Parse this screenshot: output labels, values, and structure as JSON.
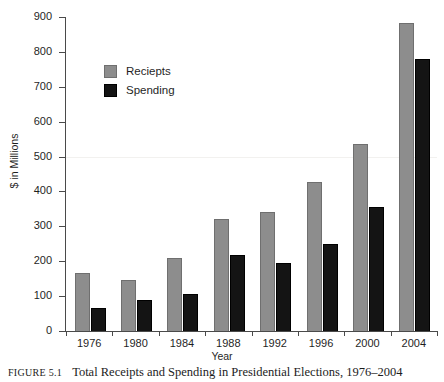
{
  "chart_data": {
    "type": "bar",
    "title": "",
    "xlabel": "Year",
    "ylabel": "$ in Millions",
    "categories": [
      "1976",
      "1980",
      "1984",
      "1988",
      "1992",
      "1996",
      "2000",
      "2004"
    ],
    "series": [
      {
        "name": "Reciepts",
        "color": "#8d8d8d",
        "values": [
          165,
          146,
          209,
          322,
          340,
          428,
          535,
          882
        ]
      },
      {
        "name": "Spending",
        "color": "#141414",
        "values": [
          67,
          89,
          105,
          217,
          195,
          249,
          355,
          779
        ]
      }
    ],
    "ylim": [
      0,
      900
    ],
    "yticks": [
      0,
      100,
      200,
      300,
      400,
      500,
      600,
      700,
      800,
      900
    ],
    "ytick_labels": [
      "0",
      "100",
      "200",
      "300",
      "400",
      "500",
      "600",
      "700",
      "800",
      "900"
    ],
    "grid": false,
    "legend_position": "upper-left-inside"
  },
  "legend": {
    "entries": [
      {
        "label": "Reciepts",
        "color": "#8d8d8d"
      },
      {
        "label": "Spending",
        "color": "#141414"
      }
    ]
  },
  "caption": {
    "label": "Figure 5.1",
    "text": "Total Receipts and Spending in Presidential Elections, 1976–2004"
  }
}
